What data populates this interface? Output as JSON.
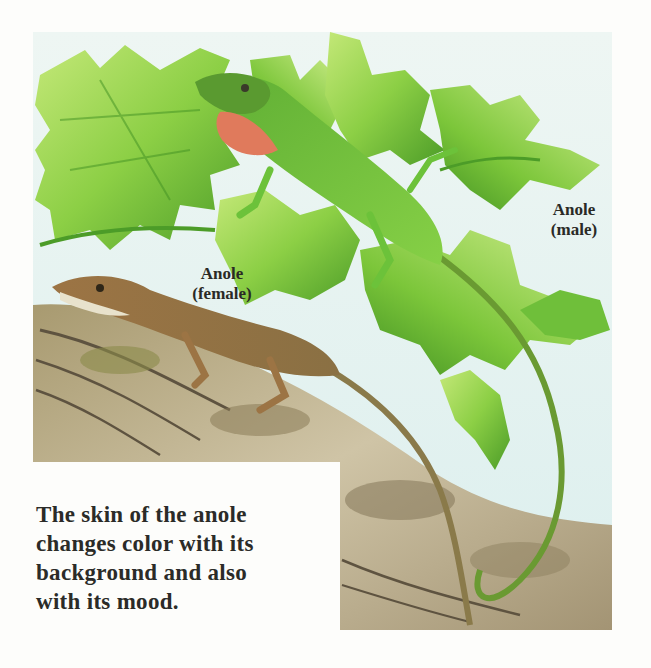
{
  "illustration": {
    "subject": "Two anoles: a green male with red dewlap on leaves and a brown female on a log",
    "colors": {
      "sky": "#e4f1ef",
      "leaf_light": "#a8dc5a",
      "leaf_mid": "#7cc63a",
      "leaf_dark": "#3f8f22",
      "male_body": "#6cc23a",
      "male_dewlap": "#e07a5c",
      "female_body": "#a0794a",
      "log": "#b8ab8a",
      "log_dark": "#5e5340"
    },
    "labels": {
      "male": [
        "Anole",
        "(male)"
      ],
      "female": [
        "Anole",
        "(female)"
      ]
    }
  },
  "caption": {
    "lines": [
      "The skin of the anole",
      "changes color with its",
      "background and also",
      "with its mood."
    ]
  }
}
